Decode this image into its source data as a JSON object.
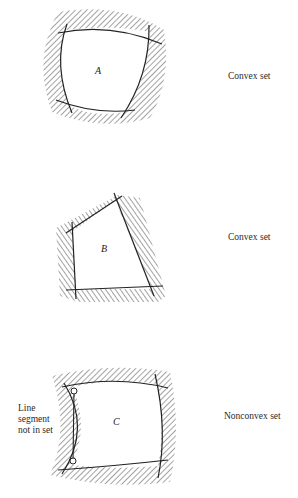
{
  "figure": {
    "panels": [
      {
        "id": "A",
        "label": "A",
        "caption": "Convex set"
      },
      {
        "id": "B",
        "label": "B",
        "caption": "Convex set"
      },
      {
        "id": "C",
        "label": "C",
        "caption": "Nonconvex set",
        "annotation": [
          "Line",
          "segment",
          "not in set"
        ]
      }
    ],
    "colors": {
      "ink": "#222222",
      "hatch": "#555555",
      "background": "#ffffff"
    }
  }
}
